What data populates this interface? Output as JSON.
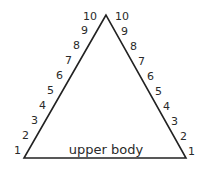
{
  "diagram": {
    "type": "triangle-scale",
    "base_label": "upper body",
    "left_scale": [
      "1",
      "2",
      "3",
      "4",
      "5",
      "6",
      "7",
      "8",
      "9",
      "10"
    ],
    "right_scale": [
      "1",
      "2",
      "3",
      "4",
      "5",
      "6",
      "7",
      "8",
      "9",
      "10"
    ],
    "line_color": "#222222",
    "text_color": "#2a2a2a"
  }
}
